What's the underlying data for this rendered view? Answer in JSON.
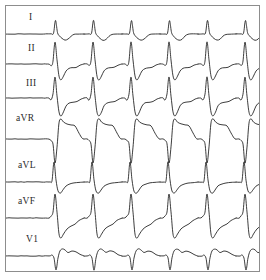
{
  "image": {
    "kind": "ecg-rhythm-strip",
    "width": 266,
    "height": 280,
    "background_color": "#ffffff",
    "border_color": "#8d8d8d",
    "trace_color": "#1a1a1a",
    "label_color": "#2a2a2a"
  },
  "chart_data": {
    "type": "line",
    "title": "",
    "subtitle": "",
    "xlabel": "",
    "ylabel": "",
    "grid": false,
    "legend_position": "left",
    "x": [
      0,
      255
    ],
    "xlim": [
      0,
      255
    ],
    "ylim": [
      0,
      267
    ],
    "beats_visible": 6,
    "beat_spacing_px": 38,
    "first_beat_x_px": 40,
    "leads": [
      {
        "name": "I",
        "label": "I",
        "label_x": 29,
        "label_y": 12,
        "baseline_y": 28,
        "morphology": "rS-like sharp R with inverted T",
        "beat": [
          [
            0,
            0
          ],
          [
            5,
            0
          ],
          [
            7.5,
            -0.8
          ],
          [
            9.5,
            -13.5
          ],
          [
            11.5,
            -1.5
          ],
          [
            13.5,
            2.0
          ],
          [
            16,
            4.5
          ],
          [
            19,
            6.2
          ],
          [
            22,
            5.2
          ],
          [
            25,
            2.2
          ],
          [
            28,
            0.4
          ],
          [
            32,
            0.0
          ],
          [
            38,
            0.0
          ]
        ]
      },
      {
        "name": "II",
        "label": "II",
        "label_x": 28,
        "label_y": 43,
        "baseline_y": 58,
        "morphology": "tall peaked R with deep S and slurred return",
        "beat": [
          [
            0,
            0
          ],
          [
            3,
            0
          ],
          [
            5.5,
            1.5
          ],
          [
            7,
            -3
          ],
          [
            9,
            -22
          ],
          [
            11,
            -4
          ],
          [
            13,
            12
          ],
          [
            15,
            16
          ],
          [
            17.5,
            12
          ],
          [
            20,
            7
          ],
          [
            23,
            4.5
          ],
          [
            26,
            3.8
          ],
          [
            30,
            3.4
          ],
          [
            34,
            1.2
          ],
          [
            38,
            0
          ]
        ]
      },
      {
        "name": "III",
        "label": "III",
        "label_x": 26,
        "label_y": 78,
        "baseline_y": 92,
        "morphology": "tall R with deep S wave, wide complex",
        "beat": [
          [
            0,
            0
          ],
          [
            3,
            0
          ],
          [
            5,
            2
          ],
          [
            7,
            -4
          ],
          [
            9,
            -21
          ],
          [
            11,
            -2
          ],
          [
            13,
            14
          ],
          [
            15,
            18
          ],
          [
            17.5,
            14
          ],
          [
            20,
            8
          ],
          [
            23,
            5
          ],
          [
            27,
            4.2
          ],
          [
            31,
            3.5
          ],
          [
            35,
            1.0
          ],
          [
            38,
            0
          ]
        ]
      },
      {
        "name": "aVR",
        "label": "aVR",
        "label_x": 16,
        "label_y": 113,
        "baseline_y": 133,
        "morphology": "predominantly negative QS with broad downward deflection",
        "beat": [
          [
            0,
            0
          ],
          [
            3,
            0
          ],
          [
            5,
            1.5
          ],
          [
            7,
            5
          ],
          [
            9,
            24
          ],
          [
            11,
            8
          ],
          [
            13,
            -16
          ],
          [
            15,
            -20
          ],
          [
            17.5,
            -17
          ],
          [
            21,
            -15
          ],
          [
            25,
            -14
          ],
          [
            29,
            -13
          ],
          [
            33,
            -6
          ],
          [
            36,
            -1
          ],
          [
            38,
            0
          ]
        ]
      },
      {
        "name": "aVL",
        "label": "aVL",
        "label_x": 18,
        "label_y": 160,
        "baseline_y": 176,
        "morphology": "sharp tall R wave with small S",
        "beat": [
          [
            0,
            0
          ],
          [
            4,
            0
          ],
          [
            6,
            -1
          ],
          [
            8,
            -20
          ],
          [
            10,
            -2
          ],
          [
            12,
            9
          ],
          [
            14.5,
            11
          ],
          [
            17,
            8
          ],
          [
            20,
            4
          ],
          [
            24,
            2
          ],
          [
            28,
            1
          ],
          [
            33,
            0.5
          ],
          [
            38,
            0
          ]
        ]
      },
      {
        "name": "aVF",
        "label": "aVF",
        "label_x": 18,
        "label_y": 196,
        "baseline_y": 212,
        "morphology": "deep S wave with rounded bulging T, crosses aVL trace",
        "beat": [
          [
            0,
            0
          ],
          [
            3,
            0
          ],
          [
            5,
            -2
          ],
          [
            7,
            -6
          ],
          [
            9,
            -24
          ],
          [
            11,
            -6
          ],
          [
            13,
            16
          ],
          [
            15,
            20
          ],
          [
            17.5,
            16
          ],
          [
            21,
            11
          ],
          [
            25,
            8
          ],
          [
            29,
            6
          ],
          [
            33,
            2.5
          ],
          [
            38,
            0
          ]
        ]
      },
      {
        "name": "V1",
        "label": "V1",
        "label_x": 26,
        "label_y": 234,
        "baseline_y": 250,
        "morphology": "rS pattern, small r wave with sharp deep S",
        "beat": [
          [
            0,
            0
          ],
          [
            4,
            0
          ],
          [
            6,
            -1
          ],
          [
            8,
            2
          ],
          [
            10,
            14
          ],
          [
            12,
            2
          ],
          [
            14,
            -5
          ],
          [
            16.5,
            -7
          ],
          [
            19,
            -6
          ],
          [
            22,
            -3.5
          ],
          [
            26,
            -5
          ],
          [
            30,
            -4
          ],
          [
            34,
            -1.5
          ],
          [
            38,
            0
          ]
        ]
      }
    ]
  }
}
